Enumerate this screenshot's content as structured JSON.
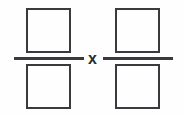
{
  "canvas": {
    "width": 184,
    "height": 116,
    "background_color": "#fefefe",
    "stroke_color": "#3a3a3e"
  },
  "expression": {
    "type": "multiplication-of-two-fractions",
    "description": "Two blank fractions joined by a multiplication sign",
    "operator": {
      "symbol": "x",
      "name": "multiplication-sign",
      "color": "#2b2b2f"
    },
    "operands": [
      {
        "name": "left-fraction",
        "numerator": {
          "name": "numerator-input-box",
          "value": "",
          "placeholder": ""
        },
        "denominator": {
          "name": "denominator-input-box",
          "value": "",
          "placeholder": ""
        }
      },
      {
        "name": "right-fraction",
        "numerator": {
          "name": "numerator-input-box",
          "value": "",
          "placeholder": ""
        },
        "denominator": {
          "name": "denominator-input-box",
          "value": "",
          "placeholder": ""
        }
      }
    ]
  }
}
